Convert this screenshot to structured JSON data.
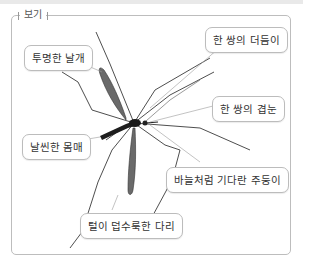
{
  "frame": {
    "title": "보기"
  },
  "labels": [
    {
      "id": "wings",
      "text": "투명한 날개"
    },
    {
      "id": "antennae",
      "text": "한 쌍의 더듬이"
    },
    {
      "id": "eyes",
      "text": "한 쌍의 겹눈"
    },
    {
      "id": "body",
      "text": "날씬한 몸매"
    },
    {
      "id": "proboscis",
      "text": "바늘처럼 기다란 주둥이"
    },
    {
      "id": "legs",
      "text": "털이 덥수룩한 다리"
    }
  ],
  "colors": {
    "frame_border": "#bdbdbd",
    "label_border": "#bcbcbc",
    "insect": "#2a2a2a",
    "leader_line": "#9a9a9a"
  }
}
